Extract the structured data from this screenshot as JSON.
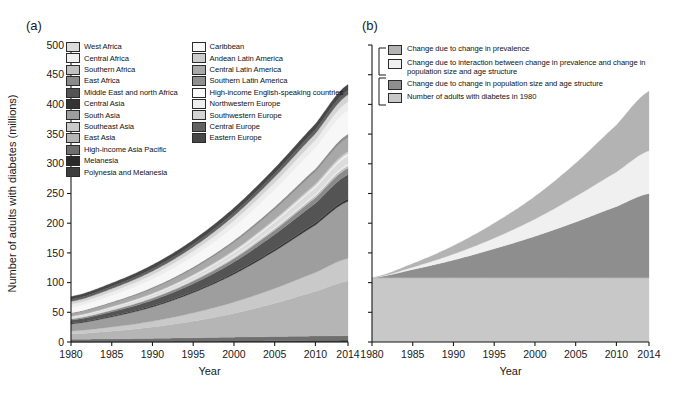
{
  "figure": {
    "panel_a_label": "(a)",
    "panel_b_label": "(b)"
  },
  "axes": {
    "xlabel": "Year",
    "ylabel": "Number of adults with diabetes (millions)",
    "xticks": [
      "1980",
      "1985",
      "1990",
      "1995",
      "2000",
      "2005",
      "2010",
      "2014"
    ],
    "xtick_values": [
      1980,
      1985,
      1990,
      1995,
      2000,
      2005,
      2010,
      2014
    ],
    "yticks": [
      "0",
      "50",
      "100",
      "150",
      "200",
      "250",
      "300",
      "350",
      "400",
      "450",
      "500"
    ],
    "ytick_values": [
      0,
      50,
      100,
      150,
      200,
      250,
      300,
      350,
      400,
      450,
      500
    ],
    "xlim": [
      1980,
      2014
    ],
    "ylim": [
      0,
      500
    ]
  },
  "chart_data": [
    {
      "id": "panel-a",
      "type": "area",
      "title": "(a)",
      "xlabel": "Year",
      "ylabel": "Number of adults with diabetes (millions)",
      "xlim": [
        1980,
        2014
      ],
      "ylim": [
        0,
        500
      ],
      "grid": false,
      "legend_position": "top-left",
      "stacked": true,
      "x": [
        1980,
        1985,
        1990,
        1995,
        2000,
        2005,
        2010,
        2014
      ],
      "series": [
        {
          "name": "Polynesia and Melanesia",
          "color": "#3d3d3d",
          "values": [
            0.3,
            0.4,
            0.5,
            0.7,
            0.9,
            1.1,
            1.3,
            1.5
          ]
        },
        {
          "name": "Melanesia",
          "color": "#2a2a2a",
          "values": [
            0.2,
            0.3,
            0.4,
            0.5,
            0.7,
            0.9,
            1.1,
            1.3
          ]
        },
        {
          "name": "High-income Asia Pacific",
          "color": "#6f6f6f",
          "values": [
            4.0,
            4.6,
            5.2,
            5.9,
            6.6,
            7.2,
            7.6,
            7.9
          ]
        },
        {
          "name": "East Asia",
          "color": "#b5b5b5",
          "values": [
            9.0,
            13.0,
            19.0,
            28.0,
            40.0,
            56.0,
            75.0,
            92.0
          ]
        },
        {
          "name": "Southeast Asia",
          "color": "#c9c9c9",
          "values": [
            5.0,
            7.0,
            10.0,
            14.0,
            19.0,
            25.0,
            32.0,
            38.0
          ]
        },
        {
          "name": "South Asia",
          "color": "#9e9e9e",
          "values": [
            12.0,
            17.0,
            24.0,
            34.0,
            47.0,
            63.0,
            80.0,
            96.0
          ]
        },
        {
          "name": "Central Asia",
          "color": "#343434",
          "values": [
            1.2,
            1.5,
            1.8,
            2.1,
            2.5,
            3.0,
            3.5,
            3.9
          ]
        },
        {
          "name": "Middle East and north Africa",
          "color": "#545454",
          "values": [
            5.0,
            7.0,
            9.5,
            13.0,
            18.0,
            25.0,
            33.0,
            41.0
          ]
        },
        {
          "name": "East Africa",
          "color": "#8a8a8a",
          "values": [
            2.0,
            2.6,
            3.4,
            4.4,
            5.6,
            7.2,
            9.2,
            11.0
          ]
        },
        {
          "name": "Southern Africa",
          "color": "#c0c0c0",
          "values": [
            0.8,
            1.0,
            1.3,
            1.7,
            2.2,
            2.8,
            3.5,
            4.1
          ]
        },
        {
          "name": "Central Africa",
          "color": "#eaeaea",
          "values": [
            0.6,
            0.8,
            1.0,
            1.3,
            1.7,
            2.2,
            2.8,
            3.3
          ]
        },
        {
          "name": "West Africa",
          "color": "#dcdcdc",
          "values": [
            2.0,
            2.7,
            3.6,
            4.8,
            6.4,
            8.5,
            11.0,
            13.5
          ]
        },
        {
          "name": "Caribbean",
          "color": "#f2f2f2",
          "values": [
            0.8,
            1.0,
            1.3,
            1.6,
            2.0,
            2.4,
            2.9,
            3.3
          ]
        },
        {
          "name": "Andean Latin America",
          "color": "#cccccc",
          "values": [
            0.7,
            0.9,
            1.2,
            1.6,
            2.1,
            2.7,
            3.4,
            4.0
          ]
        },
        {
          "name": "Central Latin America",
          "color": "#a8a8a8",
          "values": [
            4.0,
            5.4,
            7.2,
            9.6,
            12.6,
            16.0,
            20.0,
            23.0
          ]
        },
        {
          "name": "Southern Latin America",
          "color": "#8f8f8f",
          "values": [
            1.8,
            2.2,
            2.7,
            3.3,
            4.0,
            4.8,
            5.6,
            6.2
          ]
        },
        {
          "name": "High-income English-speaking countries",
          "color": "#f7f7f7",
          "values": [
            9.0,
            11.0,
            14.0,
            18.0,
            23.0,
            29.0,
            35.0,
            40.0
          ]
        },
        {
          "name": "Northwestern Europe",
          "color": "#ededed",
          "values": [
            5.5,
            6.3,
            7.3,
            8.5,
            10.0,
            11.6,
            13.2,
            14.5
          ]
        },
        {
          "name": "Southwestern Europe",
          "color": "#d4d4d4",
          "values": [
            4.5,
            5.2,
            6.0,
            7.0,
            8.2,
            9.5,
            10.8,
            11.8
          ]
        },
        {
          "name": "Central Europe",
          "color": "#616161",
          "values": [
            3.2,
            3.6,
            4.1,
            4.7,
            5.4,
            6.1,
            6.8,
            7.3
          ]
        },
        {
          "name": "Eastern Europe",
          "color": "#474747",
          "values": [
            5.0,
            5.6,
            6.3,
            7.0,
            7.8,
            8.6,
            9.3,
            9.9
          ]
        }
      ]
    },
    {
      "id": "panel-b",
      "type": "area",
      "title": "(b)",
      "xlabel": "Year",
      "ylabel": "Number of adults with diabetes (millions)",
      "xlim": [
        1980,
        2014
      ],
      "ylim": [
        0,
        500
      ],
      "grid": false,
      "legend_position": "top-left",
      "stacked": true,
      "x": [
        1980,
        1985,
        1990,
        1995,
        2000,
        2005,
        2010,
        2014
      ],
      "series": [
        {
          "name": "Number of adults with diabetes in 1980",
          "color": "#c8c8c8",
          "values": [
            108,
            108,
            108,
            108,
            108,
            108,
            108,
            108
          ]
        },
        {
          "name": "Change due to change in population size and age structure",
          "color": "#8e8e8e",
          "values": [
            0,
            14,
            30,
            49,
            70,
            94,
            120,
            142
          ]
        },
        {
          "name": "Change due to interaction between change in prevalence and change in population size and age structure",
          "color": "#f0f0f0",
          "values": [
            0,
            4,
            10,
            18,
            29,
            43,
            58,
            72
          ]
        },
        {
          "name": "Change due to change in prevalence",
          "color": "#b3b3b3",
          "values": [
            0,
            6,
            14,
            25,
            38,
            56,
            79,
            100
          ]
        }
      ]
    }
  ],
  "legend_a": {
    "column1": [
      {
        "label": "West Africa",
        "color": "#dcdcdc"
      },
      {
        "label": "Central Africa",
        "color": "#f0f0f0"
      },
      {
        "label": "Southern Africa",
        "color": "#c0c0c0"
      },
      {
        "label": "East Africa",
        "color": "#8a8a8a"
      },
      {
        "label": "Middle East and north Africa",
        "color": "#545454"
      },
      {
        "label": "Central Asia",
        "color": "#343434"
      },
      {
        "label": "South Asia",
        "color": "#9e9e9e"
      },
      {
        "label": "Southeast Asia",
        "color": "#c9c9c9"
      },
      {
        "label": "East Asia",
        "color": "#b5b5b5"
      },
      {
        "label": "High-income Asia Pacific",
        "color": "#6f6f6f"
      },
      {
        "label": "Melanesia",
        "color": "#2a2a2a"
      },
      {
        "label": "Polynesia and Melanesia",
        "color": "#3d3d3d"
      }
    ],
    "column2": [
      {
        "label": "Caribbean",
        "color": "#f7f7f7"
      },
      {
        "label": "Andean Latin America",
        "color": "#cccccc"
      },
      {
        "label": "Central Latin America",
        "color": "#a8a8a8"
      },
      {
        "label": "Southern Latin America",
        "color": "#8f8f8f"
      },
      {
        "label": "High-income English-speaking countries",
        "color": "#fbfbfb"
      },
      {
        "label": "Northwestern Europe",
        "color": "#ededed"
      },
      {
        "label": "Southwestern Europe",
        "color": "#d4d4d4"
      },
      {
        "label": "Central Europe",
        "color": "#616161"
      },
      {
        "label": "Eastern Europe",
        "color": "#474747"
      }
    ]
  },
  "legend_b": {
    "items": [
      {
        "label": "Change due to change in prevalence",
        "color": "#b3b3b3"
      },
      {
        "label": "Change due to interaction between change in prevalence and change in population size and age structure",
        "color": "#f0f0f0"
      },
      {
        "label": "Change due to change in population size and age structure",
        "color": "#8e8e8e"
      },
      {
        "label": "Number of adults with diabetes in 1980",
        "color": "#c8c8c8"
      }
    ]
  }
}
